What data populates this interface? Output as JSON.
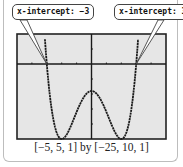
{
  "chart_data": {
    "type": "line",
    "title": "",
    "function": "y = x^4 - 8x^2 - 9",
    "window": {
      "xmin": -5,
      "xmax": 5,
      "xscl": 1,
      "ymin": -25,
      "ymax": 10,
      "yscl": 1
    },
    "xlim": [
      -5,
      5
    ],
    "ylim": [
      -25,
      10
    ],
    "grid": false,
    "series": [
      {
        "name": "y = x^4 - 8x^2 - 9",
        "x": [
          -3.4,
          -3.2,
          -3,
          -2.8,
          -2.6,
          -2.4,
          -2.2,
          -2,
          -1.8,
          -1.6,
          -1.4,
          -1.2,
          -1,
          -0.8,
          -0.6,
          -0.4,
          -0.2,
          0,
          0.2,
          0.4,
          0.6,
          0.8,
          1,
          1.2,
          1.4,
          1.6,
          1.8,
          2,
          2.2,
          2.4,
          2.6,
          2.8,
          3,
          3.2,
          3.4
        ],
        "values": [
          33.1,
          13.0,
          0,
          -8.2,
          -13.4,
          -22.9,
          -24.3,
          -25,
          -24.4,
          -22.9,
          -20.8,
          -18.4,
          -16,
          -13.7,
          -11.8,
          -10.3,
          -9.3,
          -9,
          -9.3,
          -10.3,
          -11.8,
          -13.7,
          -16,
          -18.4,
          -20.8,
          -22.9,
          -24.4,
          -25,
          -24.3,
          -22.9,
          -13.4,
          -8.2,
          0,
          13.0,
          33.1
        ]
      }
    ],
    "annotations": [
      {
        "text": "x-intercept: −3",
        "x": -3,
        "y": 0
      },
      {
        "text": "x-intercept: 3",
        "x": 3,
        "y": 0
      }
    ],
    "caption": "[−5, 5, 1] by [−25, 10, 1]",
    "colors": {
      "screen": "#e6e6e6",
      "curve": "#1a1a1a",
      "axes": "#1a1a1a"
    }
  }
}
